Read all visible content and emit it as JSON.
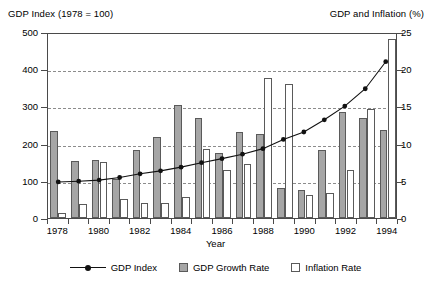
{
  "chart_data": {
    "type": "bar",
    "title": "",
    "xlabel": "Year",
    "ylabel": "GDP Index (1978 = 100)",
    "y2label": "GDP and Inflation (%)",
    "left_axis_caption": "GDP Index (1978 = 100)",
    "right_axis_caption": "GDP and Inflation (%)",
    "grid": true,
    "legend_position": "bottom",
    "ylim": [
      0,
      500
    ],
    "y2lim": [
      0,
      25
    ],
    "yticks": [
      0,
      100,
      200,
      300,
      400,
      500
    ],
    "y2ticks": [
      0,
      5,
      10,
      15,
      20,
      25
    ],
    "categories": [
      1978,
      1979,
      1980,
      1981,
      1982,
      1983,
      1984,
      1985,
      1986,
      1987,
      1988,
      1989,
      1990,
      1991,
      1992,
      1993,
      1994
    ],
    "xtick_labels": [
      "1978",
      "1980",
      "1982",
      "1984",
      "1986",
      "1988",
      "1990",
      "1992",
      "1994"
    ],
    "xtick_values": [
      1978,
      1980,
      1982,
      1984,
      1986,
      1988,
      1990,
      1992,
      1994
    ],
    "series": [
      {
        "name": "GDP Index",
        "type": "line",
        "axis": "left",
        "marker": "filled-circle",
        "color": "#111111",
        "values": [
          100,
          102,
          105,
          112,
          122,
          130,
          140,
          152,
          163,
          175,
          190,
          215,
          235,
          268,
          305,
          352,
          425
        ]
      },
      {
        "name": "GDP Growth Rate",
        "type": "bar",
        "axis": "right",
        "color": "#a6a6a6",
        "values": [
          11.7,
          7.6,
          7.8,
          5.2,
          9.1,
          10.9,
          15.2,
          13.5,
          8.8,
          11.6,
          11.3,
          4.1,
          3.8,
          9.2,
          14.2,
          13.5,
          11.8
        ]
      },
      {
        "name": "Inflation Rate",
        "type": "bar",
        "axis": "right",
        "color": "#ffffff",
        "values": [
          0.7,
          1.9,
          7.5,
          2.5,
          2.0,
          2.0,
          2.8,
          9.3,
          6.5,
          7.3,
          18.8,
          18.0,
          3.1,
          3.4,
          6.4,
          14.7,
          24.1
        ]
      }
    ],
    "legend": [
      "GDP Index",
      "GDP Growth Rate",
      "Inflation Rate"
    ]
  }
}
